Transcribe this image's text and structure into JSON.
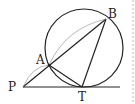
{
  "diagram": {
    "type": "geometry",
    "points": {
      "P": {
        "label": "P",
        "x": 23,
        "y": 87
      },
      "A": {
        "label": "A",
        "x": 49,
        "y": 65
      },
      "B": {
        "label": "B",
        "x": 106,
        "y": 19
      },
      "T": {
        "label": "T",
        "x": 82,
        "y": 87
      }
    },
    "circle": {
      "cx": 84,
      "cy": 48,
      "r": 39
    },
    "segments": [
      {
        "from": "P",
        "to": "B",
        "name": "secant-PAB"
      },
      {
        "from": "A",
        "to": "T",
        "name": "chord-AT"
      },
      {
        "from": "B",
        "to": "T",
        "name": "chord-BT"
      },
      {
        "from": "P",
        "to": "tangent-end",
        "name": "tangent-PT"
      }
    ],
    "colors": {
      "stroke": "#222222",
      "faint": "#9a9a9a",
      "dashed": "#bbbbbb"
    }
  }
}
